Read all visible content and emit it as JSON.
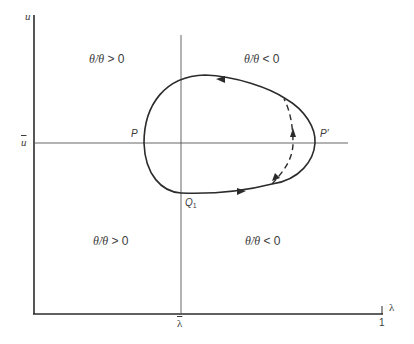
{
  "figure": {
    "y_axis_label": "u",
    "x_axis_label": "λ",
    "u_bar_label": "u",
    "lambda_bar_label": "λ",
    "x_end_tick_label": "1",
    "points": {
      "P": "P",
      "P_prime": "P′",
      "Q1_main": "Q",
      "Q1_sub": "1"
    },
    "regions": {
      "top_left": {
        "lhs": "θ̇/θ",
        "rel": " > 0"
      },
      "top_right": {
        "lhs": "θ̇/θ",
        "rel": " < 0"
      },
      "bottom_left": {
        "lhs": "θ̇/θ",
        "rel": " > 0"
      },
      "bottom_right": {
        "lhs": "θ̇/θ",
        "rel": " < 0"
      }
    },
    "colors": {
      "ink": "#2b2b2b",
      "thin_line": "#555555",
      "background": "#ffffff"
    }
  }
}
